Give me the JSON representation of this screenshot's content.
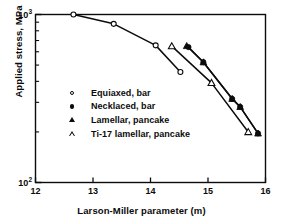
{
  "chart_data": {
    "type": "line",
    "title": "",
    "xlabel": "Larson-Miller parameter (m)",
    "ylabel": "Applied stress, MPa",
    "xlim": [
      12,
      16
    ],
    "ylim": [
      100,
      1000
    ],
    "yscale": "log",
    "xscale": "linear",
    "grid": false,
    "legend_position": "center-left",
    "xticks": [
      "12",
      "13",
      "14",
      "15",
      "16"
    ],
    "xtick_values": [
      12,
      13,
      14,
      15,
      16
    ],
    "yticks": [
      "10",
      "10"
    ],
    "ytick_exponents": [
      "3",
      "2"
    ],
    "ytick_values": [
      1000,
      100
    ],
    "series": [
      {
        "name": "Equiaxed, bar",
        "marker": "open-circle",
        "points": [
          {
            "x": 12.66,
            "y": 1000
          },
          {
            "x": 13.36,
            "y": 880
          },
          {
            "x": 14.09,
            "y": 655
          },
          {
            "x": 14.52,
            "y": 455
          }
        ]
      },
      {
        "name": "Necklaced, bar",
        "marker": "filled-circle",
        "points": [
          {
            "x": 14.66,
            "y": 640
          },
          {
            "x": 14.92,
            "y": 520
          },
          {
            "x": 15.42,
            "y": 315
          },
          {
            "x": 15.56,
            "y": 282
          },
          {
            "x": 15.87,
            "y": 196
          }
        ]
      },
      {
        "name": "Lamellar, pancake",
        "marker": "filled-triangle",
        "points": [
          {
            "x": 14.63,
            "y": 650
          },
          {
            "x": 14.92,
            "y": 520
          },
          {
            "x": 15.42,
            "y": 315
          },
          {
            "x": 15.56,
            "y": 282
          },
          {
            "x": 15.87,
            "y": 196
          }
        ]
      },
      {
        "name": "Ti-17 lamellar, pancake",
        "marker": "open-triangle",
        "points": [
          {
            "x": 14.37,
            "y": 648
          },
          {
            "x": 15.06,
            "y": 392
          },
          {
            "x": 15.7,
            "y": 200
          }
        ]
      }
    ]
  },
  "legend": {
    "items": [
      {
        "label": "Equiaxed, bar",
        "marker": "open-circle"
      },
      {
        "label": "Necklaced, bar",
        "marker": "filled-circle"
      },
      {
        "label": "Lamellar, pancake",
        "marker": "filled-triangle"
      },
      {
        "label": "Ti-17 lamellar, pancake",
        "marker": "open-triangle"
      }
    ]
  },
  "axes": {
    "x_title": "Larson-Miller parameter (m)",
    "y_title": "Applied stress, MPa",
    "y_base": "10",
    "y_top_exp": "3",
    "y_bottom_exp": "2"
  }
}
